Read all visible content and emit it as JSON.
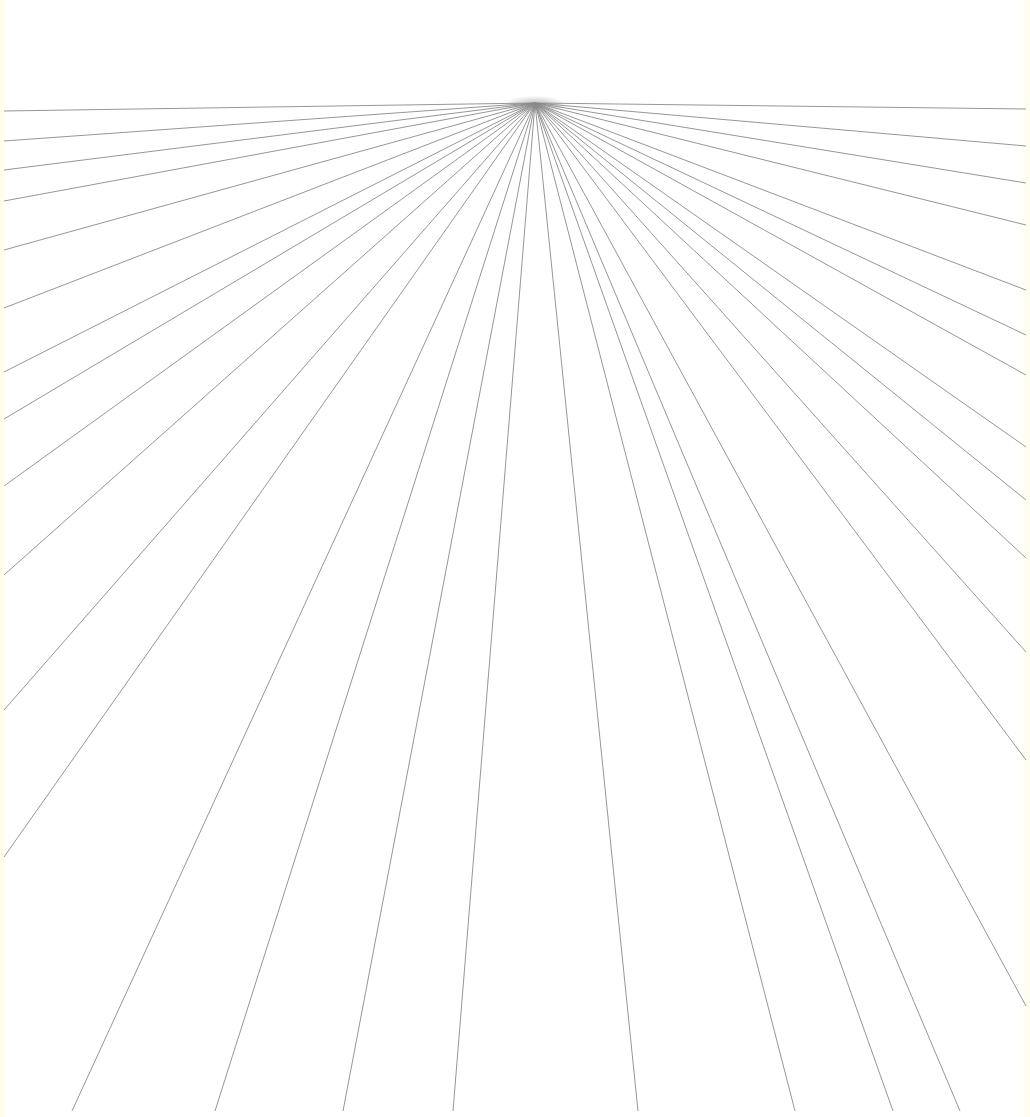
{
  "diagram": {
    "type": "one-point-perspective-radiating-lines",
    "canvas": {
      "width": 1030,
      "height": 1117,
      "background": "#fffffb"
    },
    "line_color": "#8a8a8a",
    "vanishing_point": {
      "x": 535,
      "y": 103
    },
    "endpoints": {
      "left_edge": [
        {
          "x": 4,
          "y": 111
        },
        {
          "x": 4,
          "y": 141
        },
        {
          "x": 4,
          "y": 170
        },
        {
          "x": 4,
          "y": 201
        },
        {
          "x": 4,
          "y": 250
        },
        {
          "x": 4,
          "y": 308
        },
        {
          "x": 4,
          "y": 372
        },
        {
          "x": 4,
          "y": 419
        },
        {
          "x": 4,
          "y": 486
        },
        {
          "x": 4,
          "y": 575
        },
        {
          "x": 4,
          "y": 710
        },
        {
          "x": 4,
          "y": 857
        }
      ],
      "bottom_edge": [
        {
          "x": 72,
          "y": 1111
        },
        {
          "x": 215,
          "y": 1111
        },
        {
          "x": 343,
          "y": 1111
        },
        {
          "x": 453,
          "y": 1111
        },
        {
          "x": 638,
          "y": 1111
        },
        {
          "x": 795,
          "y": 1111
        },
        {
          "x": 893,
          "y": 1111
        },
        {
          "x": 960,
          "y": 1111
        }
      ],
      "right_edge": [
        {
          "x": 1026,
          "y": 109
        },
        {
          "x": 1026,
          "y": 146
        },
        {
          "x": 1026,
          "y": 183
        },
        {
          "x": 1026,
          "y": 225
        },
        {
          "x": 1026,
          "y": 290
        },
        {
          "x": 1026,
          "y": 335
        },
        {
          "x": 1026,
          "y": 375
        },
        {
          "x": 1026,
          "y": 447
        },
        {
          "x": 1026,
          "y": 500
        },
        {
          "x": 1026,
          "y": 558
        },
        {
          "x": 1026,
          "y": 652
        },
        {
          "x": 1026,
          "y": 760
        },
        {
          "x": 1026,
          "y": 1006
        }
      ]
    }
  }
}
